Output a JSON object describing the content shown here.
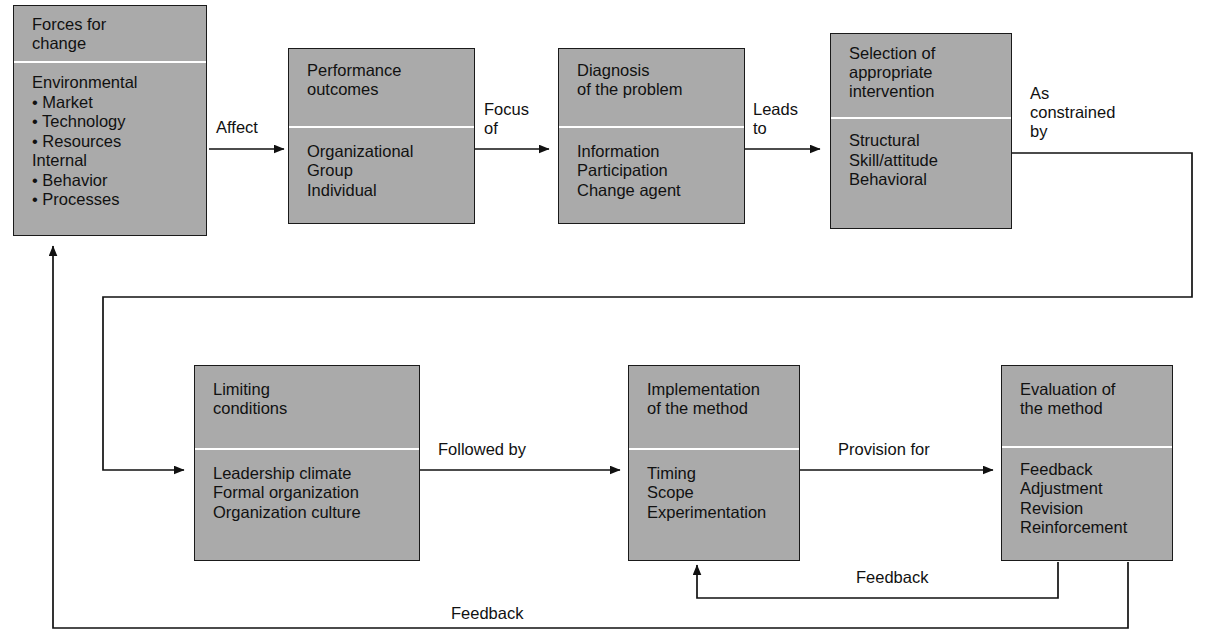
{
  "diagram": {
    "colors": {
      "box_fill": "#aaaaaa",
      "box_border": "#1a1a1a",
      "box_shadow": "#c9c9c9",
      "divider": "#ffffff",
      "text": "#111111",
      "background": "#ffffff"
    },
    "nodes": [
      {
        "id": "forces-for-change",
        "head": [
          "Forces for",
          "change"
        ],
        "body": [
          "Environmental",
          "• Market",
          "• Technology",
          "• Resources",
          "Internal",
          "• Behavior",
          "• Processes"
        ]
      },
      {
        "id": "performance-outcomes",
        "head": [
          "Performance",
          "outcomes"
        ],
        "body": [
          "Organizational",
          "Group",
          "Individual"
        ]
      },
      {
        "id": "diagnosis-of-the-problem",
        "head": [
          "Diagnosis",
          "of the problem"
        ],
        "body": [
          "Information",
          "Participation",
          "Change agent"
        ]
      },
      {
        "id": "selection-of-appropriate-intervention",
        "head": [
          "Selection of",
          "appropriate",
          "intervention"
        ],
        "body": [
          "Structural",
          "Skill/attitude",
          "Behavioral"
        ]
      },
      {
        "id": "limiting-conditions",
        "head": [
          "Limiting",
          "conditions"
        ],
        "body": [
          "Leadership climate",
          "Formal organization",
          "Organization culture"
        ]
      },
      {
        "id": "implementation-of-the-method",
        "head": [
          "Implementation",
          "of the method"
        ],
        "body": [
          "Timing",
          "Scope",
          "Experimentation"
        ]
      },
      {
        "id": "evaluation-of-the-method",
        "head": [
          "Evaluation of",
          "the method"
        ],
        "body": [
          "Feedback",
          "Adjustment",
          "Revision",
          "Reinforcement"
        ]
      }
    ],
    "edge_labels": [
      {
        "id": "affect",
        "text": "Affect"
      },
      {
        "id": "focus-of",
        "text": "Focus\nof"
      },
      {
        "id": "leads-to",
        "text": "Leads\nto"
      },
      {
        "id": "as-constrained-by",
        "text": "As\nconstrained\nby"
      },
      {
        "id": "followed-by",
        "text": "Followed by"
      },
      {
        "id": "provision-for",
        "text": "Provision for"
      },
      {
        "id": "feedback-upper",
        "text": "Feedback"
      },
      {
        "id": "feedback-lower",
        "text": "Feedback"
      }
    ]
  }
}
